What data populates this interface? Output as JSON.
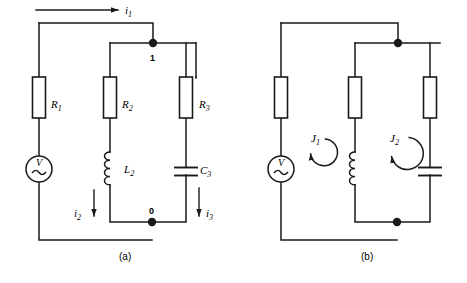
{
  "figure": {
    "type": "circuit-diagram",
    "stroke_color": "#1a1a1a",
    "background_color": "#ffffff",
    "captions": [
      {
        "id": "a",
        "text": "(a)"
      },
      {
        "id": "b",
        "text": "(b)"
      }
    ]
  },
  "circuit_a": {
    "caption": "(a)",
    "components": [
      {
        "name": "R1",
        "kind": "resistor",
        "label": "R",
        "sub": "1"
      },
      {
        "name": "R2",
        "kind": "resistor",
        "label": "R",
        "sub": "2"
      },
      {
        "name": "R3",
        "kind": "resistor",
        "label": "R",
        "sub": "3"
      },
      {
        "name": "L2",
        "kind": "inductor",
        "label": "L",
        "sub": "2"
      },
      {
        "name": "C3",
        "kind": "capacitor",
        "label": "C",
        "sub": "3"
      },
      {
        "name": "Vsource",
        "kind": "ac-voltage-source",
        "label": "V",
        "sub": ""
      }
    ],
    "nodes": [
      {
        "name": "node-1",
        "text": "1"
      },
      {
        "name": "node-0",
        "text": "0"
      }
    ],
    "currents": [
      {
        "name": "i1",
        "label": "i",
        "sub": "1",
        "direction": "right"
      },
      {
        "name": "i2",
        "label": "i",
        "sub": "2",
        "direction": "down"
      },
      {
        "name": "i3",
        "label": "i",
        "sub": "3",
        "direction": "down"
      }
    ]
  },
  "circuit_b": {
    "caption": "(b)",
    "components": [
      {
        "name": "R1",
        "kind": "resistor",
        "label": "",
        "sub": ""
      },
      {
        "name": "R2",
        "kind": "resistor",
        "label": "",
        "sub": ""
      },
      {
        "name": "R3",
        "kind": "resistor",
        "label": "",
        "sub": ""
      },
      {
        "name": "L2",
        "kind": "inductor",
        "label": "",
        "sub": ""
      },
      {
        "name": "C3",
        "kind": "capacitor",
        "label": "",
        "sub": ""
      },
      {
        "name": "Vsource",
        "kind": "ac-voltage-source",
        "label": "V",
        "sub": ""
      }
    ],
    "mesh_currents": [
      {
        "name": "J1",
        "label": "J",
        "sub": "1",
        "direction": "counterclockwise"
      },
      {
        "name": "J2",
        "label": "J",
        "sub": "2",
        "direction": "counterclockwise"
      }
    ]
  }
}
